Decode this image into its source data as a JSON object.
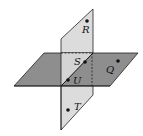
{
  "diagram": {
    "colors": {
      "vertical_plane": "#dcdcdc",
      "horizontal_plane": "#8e8e8e",
      "edge": "#222222",
      "point": "#111111"
    },
    "points": [
      {
        "label": "R",
        "x": 87,
        "y": 21,
        "lx": 82,
        "ly": 33
      },
      {
        "label": "S",
        "x": 85,
        "y": 62,
        "lx": 74,
        "ly": 65
      },
      {
        "label": "U",
        "x": 68,
        "y": 80,
        "lx": 73,
        "ly": 84
      },
      {
        "label": "Q",
        "x": 118,
        "y": 61,
        "lx": 106,
        "ly": 73
      },
      {
        "label": "T",
        "x": 68,
        "y": 110,
        "lx": 74,
        "ly": 110
      }
    ]
  }
}
